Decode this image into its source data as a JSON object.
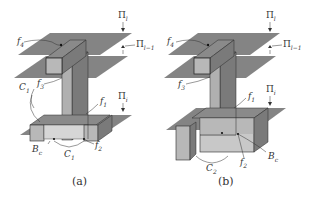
{
  "figure": {
    "panels": [
      {
        "id": "a",
        "caption": "(a)",
        "labels": {
          "f4": "f",
          "f4_sub": "4",
          "f3": "f",
          "f3_sub": "3",
          "f1": "f",
          "f1_sub": "1",
          "f2": "f",
          "f2_sub": "2",
          "c1p": "C",
          "c1p_sub": "1",
          "c1p_sup": "′",
          "bc": "B",
          "bc_sub": "c",
          "c1": "C",
          "c1_sub": "1",
          "pi_l": "Π",
          "pi_l_sub": "l",
          "pi_lm1": "Π",
          "pi_lm1_sub": "l−1",
          "pi_i": "Π",
          "pi_i_sub": "i"
        }
      },
      {
        "id": "b",
        "caption": "(b)",
        "labels": {
          "f4": "f",
          "f4_sub": "4",
          "f3": "f",
          "f3_sub": "3",
          "f1": "f",
          "f1_sub": "1",
          "f2": "f",
          "f2_sub": "2",
          "bc": "B",
          "bc_sub": "c",
          "c2": "C",
          "c2_sub": "2",
          "pi_l": "Π",
          "pi_l_sub": "l",
          "pi_lm1": "Π",
          "pi_lm1_sub": "l−1",
          "pi_i": "Π",
          "pi_i_sub": "i"
        }
      }
    ],
    "colors": {
      "plane": "#6e6e6e",
      "box_front": "#b8b8b8",
      "box_side": "#8a8a8a",
      "box_top": "#9a9a9a",
      "outline": "#2a2a2a",
      "text": "#333333"
    }
  }
}
